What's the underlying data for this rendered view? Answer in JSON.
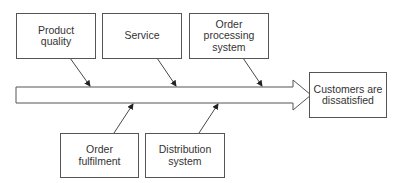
{
  "diagram": {
    "type": "cause-and-effect",
    "effect": "Customers are\ndissatisfied",
    "causes_top": [
      {
        "label": "Product\nquality"
      },
      {
        "label": "Service"
      },
      {
        "label": "Order\nprocessing\nsystem"
      }
    ],
    "causes_bottom": [
      {
        "label": "Order\nfulfilment"
      },
      {
        "label": "Distribution\nsystem"
      }
    ],
    "colors": {
      "stroke": "#555555",
      "text": "#333333",
      "background": "#ffffff"
    }
  }
}
